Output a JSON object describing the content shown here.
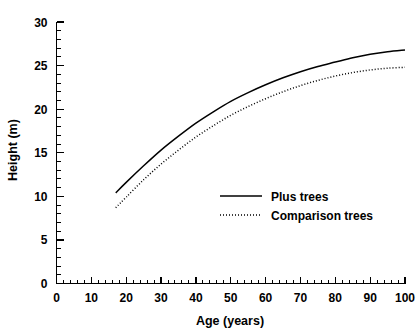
{
  "chart_data": {
    "type": "line",
    "title": "",
    "xlabel": "Age (years)",
    "ylabel": "Height (m)",
    "xlim": [
      0,
      100
    ],
    "ylim": [
      0,
      30
    ],
    "grid": false,
    "legend_position": "center-right-inside",
    "x_ticks": [
      0,
      10,
      20,
      30,
      40,
      50,
      60,
      70,
      80,
      90,
      100
    ],
    "x_tick_labels": [
      "0",
      "10",
      "20",
      "30",
      "40",
      "50",
      "60",
      "70",
      "80",
      "90",
      "100"
    ],
    "x_minor_tick_step": 2,
    "y_ticks": [
      0,
      5,
      10,
      15,
      20,
      25,
      30
    ],
    "y_tick_labels": [
      "0",
      "5",
      "10",
      "15",
      "20",
      "25",
      "30"
    ],
    "y_minor_tick_step": 1,
    "series": [
      {
        "name": "Plus trees",
        "style": "solid",
        "color": "#000000",
        "x": [
          17,
          20,
          25,
          30,
          35,
          40,
          45,
          50,
          55,
          60,
          65,
          70,
          75,
          80,
          85,
          90,
          95,
          100
        ],
        "values": [
          10.4,
          11.6,
          13.5,
          15.3,
          16.9,
          18.4,
          19.7,
          20.9,
          21.9,
          22.8,
          23.6,
          24.3,
          24.9,
          25.4,
          25.9,
          26.3,
          26.6,
          26.8
        ]
      },
      {
        "name": "Comparison trees",
        "style": "dotted",
        "color": "#000000",
        "x": [
          17,
          20,
          25,
          30,
          35,
          40,
          45,
          50,
          55,
          60,
          65,
          70,
          75,
          80,
          85,
          90,
          95,
          100
        ],
        "values": [
          8.7,
          9.9,
          11.9,
          13.7,
          15.3,
          16.8,
          18.1,
          19.3,
          20.3,
          21.2,
          22.0,
          22.7,
          23.3,
          23.8,
          24.2,
          24.5,
          24.7,
          24.8
        ]
      }
    ],
    "legend": [
      {
        "label": "Plus trees",
        "style": "solid"
      },
      {
        "label": "Comparison trees",
        "style": "dotted"
      }
    ]
  }
}
